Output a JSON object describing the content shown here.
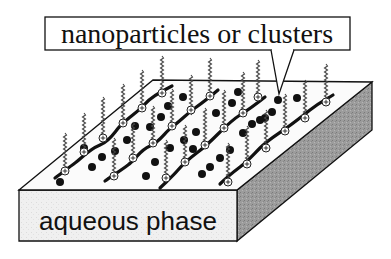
{
  "diagram": {
    "callout_label": "nanoparticles or clusters",
    "slab_label": "aqueous phase",
    "colors": {
      "outline": "#111111",
      "top_face": "#fbfbfb",
      "front_face": "#efefef",
      "side_face": "#9a9a9a",
      "particle": "#111111",
      "chain": "#555555"
    },
    "elements": {
      "surfactant_headgroup_symbol": "⊕",
      "particles": "black dots",
      "polymer_strands": "wavy black lines",
      "surfactant_tails": "vertical zigzag chains"
    }
  }
}
